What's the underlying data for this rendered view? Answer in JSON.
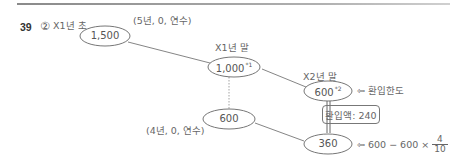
{
  "question": {
    "number": "39",
    "answer": "②"
  },
  "labels": {
    "x1_start": "X1년 초",
    "x1_end": "X1년 말",
    "x2_end": "X2년 말",
    "asset_terms_top": "(5년, 0, 연수)",
    "asset_terms_bottom": "(4년, 0, 연수)",
    "recoverable_limit": "⇦ 환입한도",
    "formula_prefix": "⇦ 600 − 600 ×",
    "formula_numerator": "4",
    "formula_denominator": "10"
  },
  "nodes": {
    "n1500": {
      "value": "1,500",
      "note": ""
    },
    "n1000": {
      "value": "1,000",
      "note": "*1"
    },
    "n600_top": {
      "value": "600",
      "note": "*2"
    },
    "n600_bottom": {
      "value": "600",
      "note": ""
    },
    "n360": {
      "value": "360",
      "note": ""
    }
  },
  "reversal_box": {
    "text": "환입액: 240"
  },
  "colors": {
    "line": "#777777",
    "text": "#555555",
    "rule": "#999999"
  }
}
